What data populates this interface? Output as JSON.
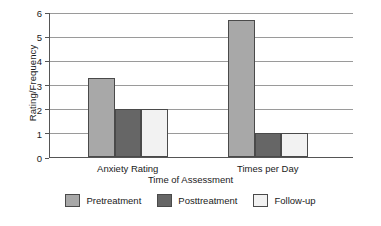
{
  "chart_data": {
    "type": "bar",
    "title": "",
    "subtitle": "",
    "xlabel": "Time of Assessment",
    "ylabel": "Rating/Frequency",
    "categories": [
      "Anxiety Rating",
      "Times per Day"
    ],
    "series": [
      {
        "name": "Pretreatment",
        "values": [
          3.25,
          5.65
        ],
        "color": "#a8a8a8"
      },
      {
        "name": "Posttreatment",
        "values": [
          2.0,
          1.0
        ],
        "color": "#666666"
      },
      {
        "name": "Follow-up",
        "values": [
          2.0,
          1.0
        ],
        "color": "#f2f2f2"
      }
    ],
    "ylim": [
      0,
      6
    ],
    "yticks": [
      "0",
      "1",
      "2",
      "3",
      "4",
      "5",
      "6"
    ],
    "grid": true,
    "legend_position": "bottom",
    "bar_edge_color": "#4a4a4a",
    "axis_color": "#555555",
    "gridline_color": "#9a9a9a"
  },
  "axes": {
    "y_title": "Rating/Frequency",
    "x_title": "Time of Assessment"
  },
  "ticks": {
    "y": [
      "6",
      "5",
      "4",
      "3",
      "2",
      "1",
      "0"
    ]
  },
  "categories": {
    "c0": "Anxiety Rating",
    "c1": "Times per Day"
  },
  "legend": {
    "items": [
      {
        "label": "Pretreatment"
      },
      {
        "label": "Posttreatment"
      },
      {
        "label": "Follow-up"
      }
    ]
  }
}
